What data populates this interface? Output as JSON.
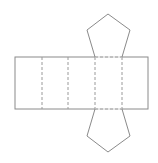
{
  "diagram": {
    "type": "net-of-pentagonal-prism",
    "stroke_color": "#8a8a8a",
    "dash_color": "#9a9a9a",
    "rectangle": {
      "x": 15,
      "y": 57,
      "width": 133,
      "height": 52
    },
    "fold_lines_x": [
      42,
      68,
      95,
      122
    ],
    "top_pentagon": "95,57 87,30 108,14 130,30 122,57",
    "bottom_pentagon": "95,109 87,136 108,152 130,136 122,109"
  }
}
